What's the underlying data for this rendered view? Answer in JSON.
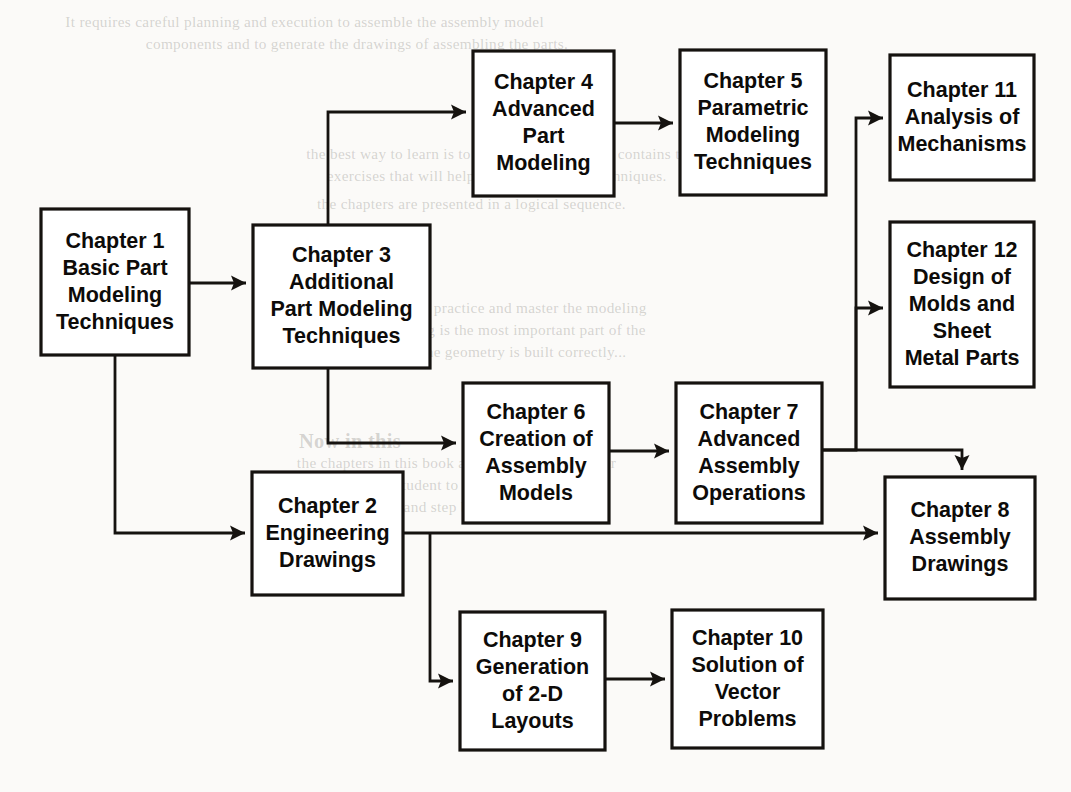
{
  "diagram": {
    "type": "flowchart",
    "background_color": "#fbfaf8",
    "box_fill": "#ffffff",
    "line_color": "#15120f",
    "nodes": [
      {
        "id": "ch1",
        "label": "Chapter 1\nBasic Part\nModeling\nTechniques",
        "lines": [
          "Chapter 1",
          "Basic Part",
          "Modeling",
          "Techniques"
        ],
        "x": 41,
        "y": 209,
        "w": 148,
        "h": 146
      },
      {
        "id": "ch3",
        "label": "Chapter 3\nAdditional\nPart Modeling\nTechniques",
        "lines": [
          "Chapter 3",
          "Additional",
          "Part Modeling",
          "Techniques"
        ],
        "x": 253,
        "y": 225,
        "w": 177,
        "h": 143
      },
      {
        "id": "ch4",
        "label": "Chapter 4\nAdvanced\nPart\nModeling",
        "lines": [
          "Chapter 4",
          "Advanced",
          "Part",
          "Modeling"
        ],
        "x": 473,
        "y": 51,
        "w": 141,
        "h": 145
      },
      {
        "id": "ch5",
        "label": "Chapter 5\nParametric\nModeling\nTechniques",
        "lines": [
          "Chapter 5",
          "Parametric",
          "Modeling",
          "Techniques"
        ],
        "x": 680,
        "y": 50,
        "w": 146,
        "h": 145
      },
      {
        "id": "ch11",
        "label": "Chapter 11\nAnalysis of\nMechanisms",
        "lines": [
          "Chapter 11",
          "Analysis of",
          "Mechanisms"
        ],
        "x": 890,
        "y": 55,
        "w": 144,
        "h": 125
      },
      {
        "id": "ch12",
        "label": "Chapter 12\nDesign of\nMolds and\nSheet\nMetal Parts",
        "lines": [
          "Chapter 12",
          "Design of",
          "Molds and",
          "Sheet",
          "Metal Parts"
        ],
        "x": 890,
        "y": 222,
        "w": 144,
        "h": 165
      },
      {
        "id": "ch6",
        "label": "Chapter 6\nCreation of\nAssembly\nModels",
        "lines": [
          "Chapter 6",
          "Creation of",
          "Assembly",
          "Models"
        ],
        "x": 463,
        "y": 383,
        "w": 146,
        "h": 140
      },
      {
        "id": "ch7",
        "label": "Chapter 7\nAdvanced\nAssembly\nOperations",
        "lines": [
          "Chapter 7",
          "Advanced",
          "Assembly",
          "Operations"
        ],
        "x": 676,
        "y": 383,
        "w": 146,
        "h": 140
      },
      {
        "id": "ch8",
        "label": "Chapter 8\nAssembly\nDrawings",
        "lines": [
          "Chapter 8",
          "Assembly",
          "Drawings"
        ],
        "x": 885,
        "y": 477,
        "w": 150,
        "h": 122
      },
      {
        "id": "ch2",
        "label": "Chapter 2\nEngineering\nDrawings",
        "lines": [
          "Chapter 2",
          "Engineering",
          "Drawings"
        ],
        "x": 252,
        "y": 472,
        "w": 151,
        "h": 123
      },
      {
        "id": "ch9",
        "label": "Chapter 9\nGeneration\nof 2-D\nLayouts",
        "lines": [
          "Chapter 9",
          "Generation",
          "of 2-D",
          "Layouts"
        ],
        "x": 460,
        "y": 612,
        "w": 145,
        "h": 138
      },
      {
        "id": "ch10",
        "label": "Chapter 10\nSolution of\nVector\nProblems",
        "lines": [
          "Chapter 10",
          "Solution of",
          "Vector",
          "Problems"
        ],
        "x": 672,
        "y": 610,
        "w": 151,
        "h": 138
      }
    ],
    "connections": [
      {
        "id": "ch1-ch3",
        "from": "ch1",
        "to": "ch3",
        "path": "M 189,283 L 246,283",
        "arrow_at": [
          246,
          283
        ],
        "arrow_dir": "right"
      },
      {
        "id": "ch3-ch4",
        "from": "ch3",
        "to": "ch4",
        "path": "M 328,225 L 328,112 L 466,112",
        "arrow_at": [
          466,
          112
        ],
        "arrow_dir": "right"
      },
      {
        "id": "ch4-ch5",
        "from": "ch4",
        "to": "ch5",
        "path": "M 614,123 L 673,123",
        "arrow_at": [
          673,
          123
        ],
        "arrow_dir": "right"
      },
      {
        "id": "ch3-ch6",
        "from": "ch3",
        "to": "ch6",
        "path": "M 328,368 L 328,443 L 456,443",
        "arrow_at": [
          456,
          443
        ],
        "arrow_dir": "right"
      },
      {
        "id": "ch6-ch7",
        "from": "ch6",
        "to": "ch7",
        "path": "M 609,451 L 669,451",
        "arrow_at": [
          669,
          451
        ],
        "arrow_dir": "right"
      },
      {
        "id": "ch7-ch11",
        "from": "ch7",
        "to": "ch11",
        "path": "M 822,450 L 856,450 L 856,118 L 883,118",
        "arrow_at": [
          883,
          118
        ],
        "arrow_dir": "right"
      },
      {
        "id": "ch7-ch12",
        "from": "ch7",
        "to": "ch12",
        "path": "M 856,450 L 856,308 L 883,308",
        "arrow_at": [
          883,
          308
        ],
        "arrow_dir": "right"
      },
      {
        "id": "ch7-ch8",
        "from": "ch7",
        "to": "ch8",
        "path": "M 822,450 L 962,450 L 962,470",
        "arrow_at": [
          962,
          470
        ],
        "arrow_dir": "down"
      },
      {
        "id": "ch1-ch2",
        "from": "ch1",
        "to": "ch2",
        "path": "M 115,355 L 115,533 L 245,533",
        "arrow_at": [
          245,
          533
        ],
        "arrow_dir": "right"
      },
      {
        "id": "ch2-ch8",
        "from": "ch2",
        "to": "ch8",
        "path": "M 403,533 L 878,533",
        "arrow_at": [
          878,
          533
        ],
        "arrow_dir": "right"
      },
      {
        "id": "ch2-ch9",
        "from": "ch2",
        "to": "ch9",
        "path": "M 430,533 L 430,681 L 453,681",
        "arrow_at": [
          453,
          681
        ],
        "arrow_dir": "right"
      },
      {
        "id": "ch9-ch10",
        "from": "ch9",
        "to": "ch10",
        "path": "M 605,679 L 665,679",
        "arrow_at": [
          665,
          679
        ],
        "arrow_dir": "right"
      }
    ]
  },
  "background_text": {
    "note": "faint bleed-through text from reverse side of scanned page",
    "lines": [
      {
        "text": "It requires careful planning and execution to assemble the assembly model",
        "x": 70,
        "y": 14,
        "size": 15,
        "bold": false
      },
      {
        "text": "components and to generate the drawings of assembling the parts.",
        "x": 150,
        "y": 36,
        "size": 15,
        "bold": false
      },
      {
        "text": "the best way to learn is to practice. This chapter contains the",
        "x": 310,
        "y": 146,
        "size": 15,
        "bold": false
      },
      {
        "text": "exercises that will help you to master the techniques.",
        "x": 330,
        "y": 168,
        "size": 15,
        "bold": false
      },
      {
        "text": "the chapters are presented in a logical sequence.",
        "x": 320,
        "y": 196,
        "size": 15,
        "bold": false
      },
      {
        "text": "It is important to practice and master the modeling",
        "x": 325,
        "y": 300,
        "size": 15,
        "bold": false
      },
      {
        "text": "techniques. Modeling is the most important part of the",
        "x": 300,
        "y": 322,
        "size": 15,
        "bold": false
      },
      {
        "text": "design work. Unless the geometry is built correctly...",
        "x": 290,
        "y": 344,
        "size": 15,
        "bold": false
      },
      {
        "text": "Now in this",
        "x": 300,
        "y": 430,
        "size": 20,
        "bold": true
      },
      {
        "text": "the chapters in this book are arranged in the order",
        "x": 300,
        "y": 455,
        "size": 15,
        "bold": false
      },
      {
        "text": "that allows the student to build the skills",
        "x": 300,
        "y": 477,
        "size": 15,
        "bold": false
      },
      {
        "text": "progressively and step by step.",
        "x": 315,
        "y": 499,
        "size": 15,
        "bold": false
      }
    ]
  }
}
